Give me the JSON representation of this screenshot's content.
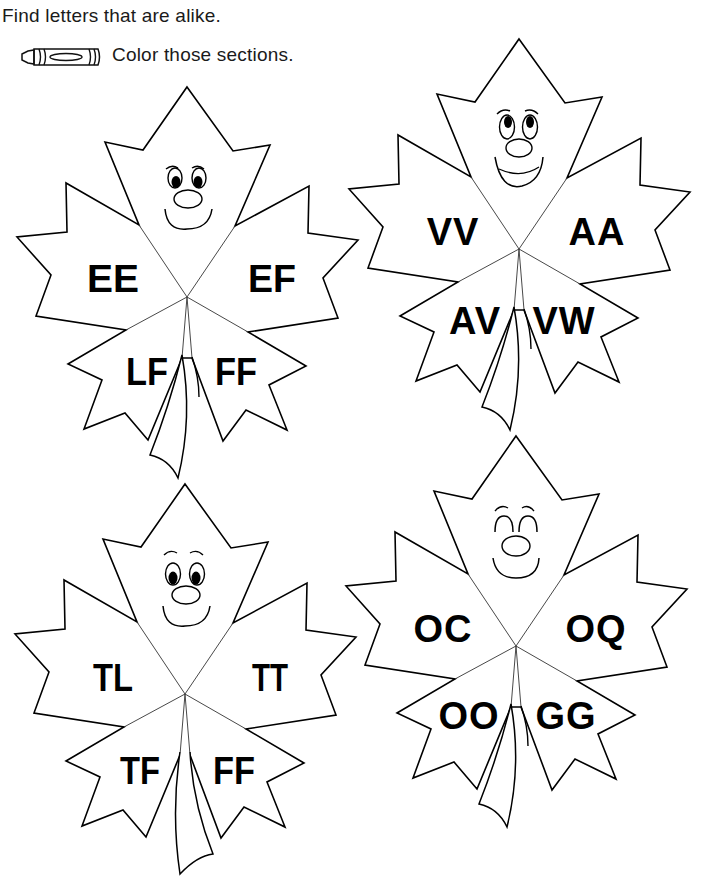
{
  "instructions": {
    "line1": "Find letters that are alike.",
    "line2": "Color those sections.",
    "icon": "crayon-icon"
  },
  "leaves": [
    {
      "position": "top-left",
      "face": "smiling-eyes-down",
      "sections": {
        "upper_left": "EE",
        "upper_right": "EF",
        "lower_left": "LF",
        "lower_right": "FF"
      }
    },
    {
      "position": "top-right",
      "face": "grinning-eyes-up",
      "sections": {
        "upper_left": "VV",
        "upper_right": "AA",
        "lower_left": "AV",
        "lower_right": "VW"
      }
    },
    {
      "position": "bottom-left",
      "face": "worried-smile",
      "sections": {
        "upper_left": "TL",
        "upper_right": "TT",
        "lower_left": "TF",
        "lower_right": "FF"
      }
    },
    {
      "position": "bottom-right",
      "face": "eyes-closed-smile",
      "sections": {
        "upper_left": "OC",
        "upper_right": "OQ",
        "lower_left": "OO",
        "lower_right": "GG"
      }
    }
  ],
  "colors": {
    "ink": "#000000",
    "background": "#ffffff"
  }
}
